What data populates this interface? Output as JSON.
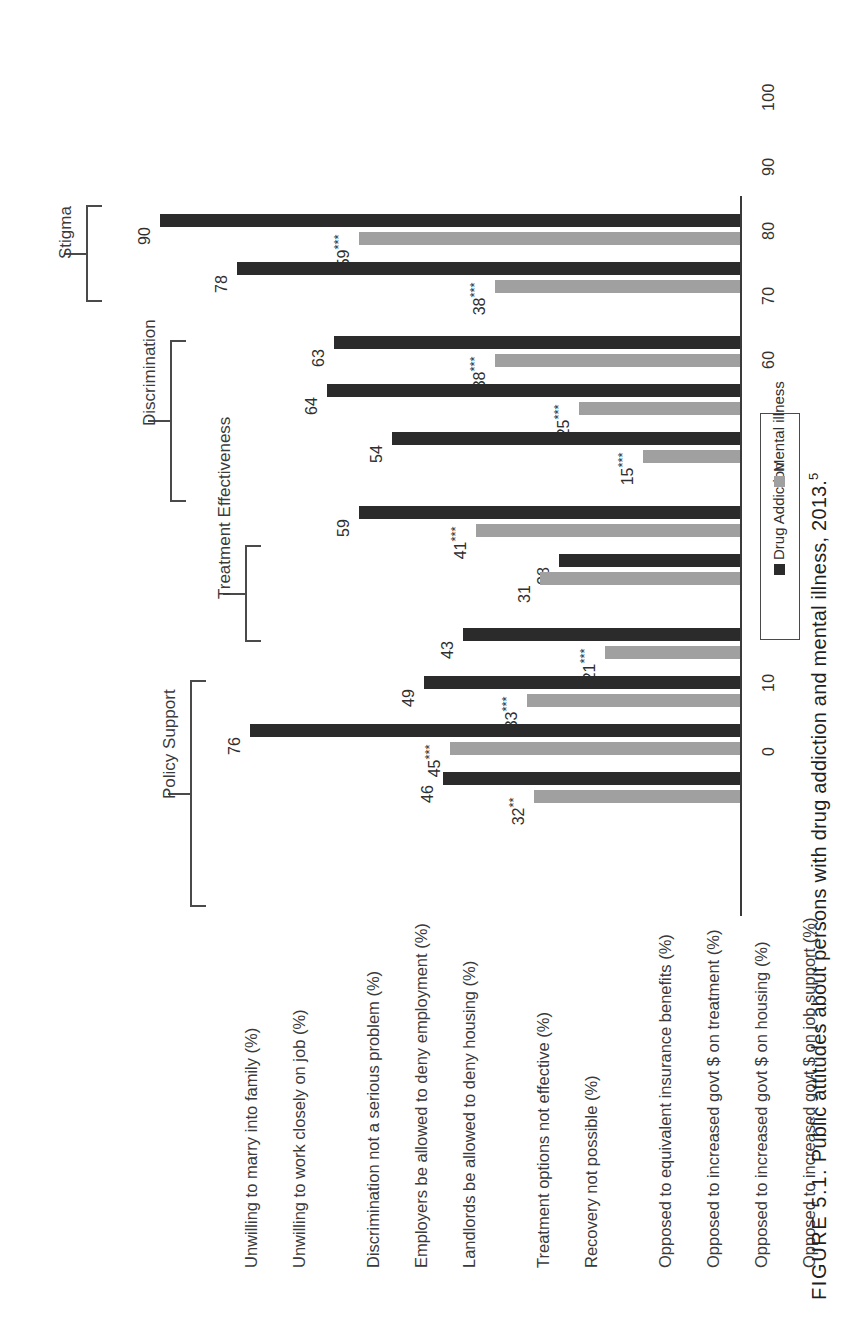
{
  "caption": {
    "figure_number": "FIGURE 5.1.",
    "text": "Public attitudes about persons with drug addiction and mental illness, 2013.",
    "footnote_marker": "5"
  },
  "legend": {
    "entries": [
      {
        "label": "Drug Addiction",
        "color": "#2b2b2b"
      },
      {
        "label": "Mental illness",
        "color": "#a0a0a0"
      }
    ]
  },
  "axis": {
    "ticks": [
      "0",
      "10",
      "20",
      "30",
      "40",
      "50",
      "60",
      "70",
      "80",
      "90",
      "100"
    ]
  },
  "groups": [
    {
      "name": "Stigma"
    },
    {
      "name": "Discrimination"
    },
    {
      "name": "Treatment Effectiveness"
    },
    {
      "name": "Policy Support"
    }
  ],
  "chart_data": {
    "type": "bar",
    "orientation": "horizontal",
    "title": "Public attitudes about persons with drug addiction and mental illness, 2013.",
    "xlabel": "",
    "ylabel": "",
    "xlim": [
      0,
      100
    ],
    "xticks": [
      0,
      10,
      20,
      30,
      40,
      50,
      60,
      70,
      80,
      90,
      100
    ],
    "grid": false,
    "legend_position": "right",
    "series": [
      {
        "name": "Drug Addiction",
        "color": "#2b2b2b"
      },
      {
        "name": "Mental illness",
        "color": "#a0a0a0"
      }
    ],
    "groups": [
      "Stigma",
      "Discrimination",
      "Treatment Effectiveness",
      "Policy Support"
    ],
    "categories": [
      "Unwilling to marry into family (%)",
      "Unwilling to work closely on job (%)",
      "Discrimination not a serious problem (%)",
      "Employers be allowed to deny employment (%)",
      "Landlords be allowed to deny housing (%)",
      "Treatment options not effective (%)",
      "Recovery not possible (%)",
      "Opposed to equivalent insurance benefits (%)",
      "Opposed to increased govt $ on treatment (%)",
      "Opposed to increased govt $ on housing (%)",
      "Opposed to increased govt $ on job support (%)"
    ],
    "bars": [
      {
        "category": "Unwilling to marry into family (%)",
        "group": "Stigma",
        "drug_addiction": 90,
        "drug_addiction_label": "90",
        "mental_illness": 59,
        "mental_illness_label": "59",
        "mental_illness_sig": "***"
      },
      {
        "category": "Unwilling to work closely on job (%)",
        "group": "Stigma",
        "drug_addiction": 78,
        "drug_addiction_label": "78",
        "mental_illness": 38,
        "mental_illness_label": "38",
        "mental_illness_sig": "***"
      },
      {
        "category": "Discrimination not a serious problem (%)",
        "group": "Discrimination",
        "drug_addiction": 63,
        "drug_addiction_label": "63",
        "mental_illness": 38,
        "mental_illness_label": "38",
        "mental_illness_sig": "***"
      },
      {
        "category": "Employers be allowed to deny employment (%)",
        "group": "Discrimination",
        "drug_addiction": 64,
        "drug_addiction_label": "64",
        "mental_illness": 25,
        "mental_illness_label": "25",
        "mental_illness_sig": "***"
      },
      {
        "category": "Landlords be allowed to deny housing (%)",
        "group": "Discrimination",
        "drug_addiction": 54,
        "drug_addiction_label": "54",
        "mental_illness": 15,
        "mental_illness_label": "15",
        "mental_illness_sig": "***"
      },
      {
        "category": "Treatment options not effective (%)",
        "group": "Treatment Effectiveness",
        "drug_addiction": 59,
        "drug_addiction_label": "59",
        "mental_illness": 41,
        "mental_illness_label": "41",
        "mental_illness_sig": "***"
      },
      {
        "category": "Recovery not possible (%)",
        "group": "Treatment Effectiveness",
        "drug_addiction": 28,
        "drug_addiction_label": "28",
        "mental_illness": 31,
        "mental_illness_label": "31",
        "mental_illness_sig": ""
      },
      {
        "category": "Opposed to equivalent insurance benefits (%)",
        "group": "Policy Support",
        "drug_addiction": 43,
        "drug_addiction_label": "43",
        "mental_illness": 21,
        "mental_illness_label": "21",
        "mental_illness_sig": "***"
      },
      {
        "category": "Opposed to increased govt $ on treatment (%)",
        "group": "Policy Support",
        "drug_addiction": 49,
        "drug_addiction_label": "49",
        "mental_illness": 33,
        "mental_illness_label": "33",
        "mental_illness_sig": "***"
      },
      {
        "category": "Opposed to increased govt $ on housing (%)",
        "group": "Policy Support",
        "drug_addiction": 76,
        "drug_addiction_label": "76",
        "mental_illness": 45,
        "mental_illness_label": "45",
        "mental_illness_sig": "***"
      },
      {
        "category": "Opposed to increased govt $ on job support (%)",
        "group": "Policy Support",
        "drug_addiction": 46,
        "drug_addiction_label": "46",
        "mental_illness": 32,
        "mental_illness_label": "32",
        "mental_illness_sig": "**"
      }
    ]
  }
}
